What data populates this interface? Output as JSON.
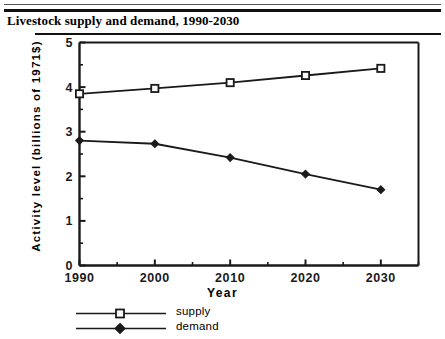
{
  "chart_data": {
    "type": "line",
    "title": "Livestock supply and demand, 1990-2030",
    "xlabel": "Year",
    "ylabel": "Activity  level  (billions  of  1971$)",
    "x": [
      1990,
      2000,
      2010,
      2020,
      2030
    ],
    "xticklabels": [
      "1990",
      "2000",
      "2010",
      "2020",
      "2030"
    ],
    "yticklabels": [
      "0",
      "1",
      "2",
      "3",
      "4",
      "5"
    ],
    "xlim": [
      1990,
      2035
    ],
    "ylim": [
      0,
      5
    ],
    "grid": false,
    "legend_position": "below-left",
    "minor_ticks": true,
    "series": [
      {
        "name": "supply",
        "marker": "open-square",
        "values": [
          3.85,
          3.97,
          4.1,
          4.26,
          4.42
        ]
      },
      {
        "name": "demand",
        "marker": "filled-diamond",
        "values": [
          2.8,
          2.73,
          2.42,
          2.05,
          1.7
        ]
      }
    ]
  },
  "legend": {
    "items": [
      {
        "label": "supply"
      },
      {
        "label": "demand"
      }
    ]
  },
  "colors": {
    "line": "#1a1a1a",
    "axis": "#1a1a1a",
    "background": "#ffffff"
  }
}
